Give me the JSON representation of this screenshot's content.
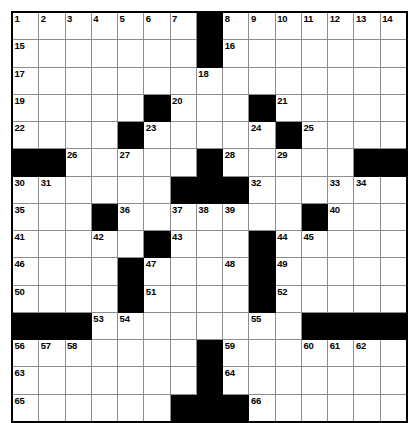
{
  "puzzle": {
    "type": "crossword-grid",
    "title": "",
    "rows": 15,
    "columns": 15,
    "colors": {
      "block": "#000000",
      "cell": "#ffffff",
      "grid_line": "#8d8d8d",
      "outer_border": "#000000",
      "number_text": "#000000"
    },
    "legend": {
      "block_label": "blocked-square",
      "open_label": "open-square"
    },
    "grid": [
      [
        {
          "block": false,
          "num": "1"
        },
        {
          "block": false,
          "num": "2"
        },
        {
          "block": false,
          "num": "3"
        },
        {
          "block": false,
          "num": "4"
        },
        {
          "block": false,
          "num": "5"
        },
        {
          "block": false,
          "num": "6"
        },
        {
          "block": false,
          "num": "7"
        },
        {
          "block": true,
          "num": ""
        },
        {
          "block": false,
          "num": "8"
        },
        {
          "block": false,
          "num": "9"
        },
        {
          "block": false,
          "num": "10"
        },
        {
          "block": false,
          "num": "11"
        },
        {
          "block": false,
          "num": "12"
        },
        {
          "block": false,
          "num": "13"
        },
        {
          "block": false,
          "num": "14"
        }
      ],
      [
        {
          "block": false,
          "num": "15"
        },
        {
          "block": false,
          "num": ""
        },
        {
          "block": false,
          "num": ""
        },
        {
          "block": false,
          "num": ""
        },
        {
          "block": false,
          "num": ""
        },
        {
          "block": false,
          "num": ""
        },
        {
          "block": false,
          "num": ""
        },
        {
          "block": true,
          "num": ""
        },
        {
          "block": false,
          "num": "16"
        },
        {
          "block": false,
          "num": ""
        },
        {
          "block": false,
          "num": ""
        },
        {
          "block": false,
          "num": ""
        },
        {
          "block": false,
          "num": ""
        },
        {
          "block": false,
          "num": ""
        },
        {
          "block": false,
          "num": ""
        }
      ],
      [
        {
          "block": false,
          "num": "17"
        },
        {
          "block": false,
          "num": ""
        },
        {
          "block": false,
          "num": ""
        },
        {
          "block": false,
          "num": ""
        },
        {
          "block": false,
          "num": ""
        },
        {
          "block": false,
          "num": ""
        },
        {
          "block": false,
          "num": ""
        },
        {
          "block": false,
          "num": "18"
        },
        {
          "block": false,
          "num": ""
        },
        {
          "block": false,
          "num": ""
        },
        {
          "block": false,
          "num": ""
        },
        {
          "block": false,
          "num": ""
        },
        {
          "block": false,
          "num": ""
        },
        {
          "block": false,
          "num": ""
        },
        {
          "block": false,
          "num": ""
        }
      ],
      [
        {
          "block": false,
          "num": "19"
        },
        {
          "block": false,
          "num": ""
        },
        {
          "block": false,
          "num": ""
        },
        {
          "block": false,
          "num": ""
        },
        {
          "block": false,
          "num": ""
        },
        {
          "block": true,
          "num": ""
        },
        {
          "block": false,
          "num": "20"
        },
        {
          "block": false,
          "num": ""
        },
        {
          "block": false,
          "num": ""
        },
        {
          "block": true,
          "num": ""
        },
        {
          "block": false,
          "num": "21"
        },
        {
          "block": false,
          "num": ""
        },
        {
          "block": false,
          "num": ""
        },
        {
          "block": false,
          "num": ""
        },
        {
          "block": false,
          "num": ""
        }
      ],
      [
        {
          "block": false,
          "num": "22"
        },
        {
          "block": false,
          "num": ""
        },
        {
          "block": false,
          "num": ""
        },
        {
          "block": false,
          "num": ""
        },
        {
          "block": true,
          "num": ""
        },
        {
          "block": false,
          "num": "23"
        },
        {
          "block": false,
          "num": ""
        },
        {
          "block": false,
          "num": ""
        },
        {
          "block": false,
          "num": ""
        },
        {
          "block": false,
          "num": "24"
        },
        {
          "block": true,
          "num": ""
        },
        {
          "block": false,
          "num": "25"
        },
        {
          "block": false,
          "num": ""
        },
        {
          "block": false,
          "num": ""
        },
        {
          "block": false,
          "num": ""
        }
      ],
      [
        {
          "block": true,
          "num": ""
        },
        {
          "block": true,
          "num": ""
        },
        {
          "block": false,
          "num": "26"
        },
        {
          "block": false,
          "num": ""
        },
        {
          "block": false,
          "num": "27"
        },
        {
          "block": false,
          "num": ""
        },
        {
          "block": false,
          "num": ""
        },
        {
          "block": true,
          "num": ""
        },
        {
          "block": false,
          "num": "28"
        },
        {
          "block": false,
          "num": ""
        },
        {
          "block": false,
          "num": "29"
        },
        {
          "block": false,
          "num": ""
        },
        {
          "block": false,
          "num": ""
        },
        {
          "block": true,
          "num": ""
        },
        {
          "block": true,
          "num": ""
        }
      ],
      [
        {
          "block": false,
          "num": "30"
        },
        {
          "block": false,
          "num": "31"
        },
        {
          "block": false,
          "num": ""
        },
        {
          "block": false,
          "num": ""
        },
        {
          "block": false,
          "num": ""
        },
        {
          "block": false,
          "num": ""
        },
        {
          "block": true,
          "num": ""
        },
        {
          "block": true,
          "num": ""
        },
        {
          "block": true,
          "num": ""
        },
        {
          "block": false,
          "num": "32"
        },
        {
          "block": false,
          "num": ""
        },
        {
          "block": false,
          "num": ""
        },
        {
          "block": false,
          "num": "33"
        },
        {
          "block": false,
          "num": "34"
        },
        {
          "block": false,
          "num": ""
        }
      ],
      [
        {
          "block": false,
          "num": "35"
        },
        {
          "block": false,
          "num": ""
        },
        {
          "block": false,
          "num": ""
        },
        {
          "block": true,
          "num": ""
        },
        {
          "block": false,
          "num": "36"
        },
        {
          "block": false,
          "num": ""
        },
        {
          "block": false,
          "num": "37"
        },
        {
          "block": false,
          "num": "38"
        },
        {
          "block": false,
          "num": "39"
        },
        {
          "block": false,
          "num": ""
        },
        {
          "block": false,
          "num": ""
        },
        {
          "block": true,
          "num": ""
        },
        {
          "block": false,
          "num": "40"
        },
        {
          "block": false,
          "num": ""
        },
        {
          "block": false,
          "num": ""
        }
      ],
      [
        {
          "block": false,
          "num": "41"
        },
        {
          "block": false,
          "num": ""
        },
        {
          "block": false,
          "num": ""
        },
        {
          "block": false,
          "num": "42"
        },
        {
          "block": false,
          "num": ""
        },
        {
          "block": true,
          "num": ""
        },
        {
          "block": false,
          "num": "43"
        },
        {
          "block": false,
          "num": ""
        },
        {
          "block": false,
          "num": ""
        },
        {
          "block": true,
          "num": ""
        },
        {
          "block": false,
          "num": "44"
        },
        {
          "block": false,
          "num": "45"
        },
        {
          "block": false,
          "num": ""
        },
        {
          "block": false,
          "num": ""
        },
        {
          "block": false,
          "num": ""
        }
      ],
      [
        {
          "block": false,
          "num": "46"
        },
        {
          "block": false,
          "num": ""
        },
        {
          "block": false,
          "num": ""
        },
        {
          "block": false,
          "num": ""
        },
        {
          "block": true,
          "num": ""
        },
        {
          "block": false,
          "num": "47"
        },
        {
          "block": false,
          "num": ""
        },
        {
          "block": false,
          "num": ""
        },
        {
          "block": false,
          "num": "48"
        },
        {
          "block": true,
          "num": ""
        },
        {
          "block": false,
          "num": "49"
        },
        {
          "block": false,
          "num": ""
        },
        {
          "block": false,
          "num": ""
        },
        {
          "block": false,
          "num": ""
        },
        {
          "block": false,
          "num": ""
        }
      ],
      [
        {
          "block": false,
          "num": "50"
        },
        {
          "block": false,
          "num": ""
        },
        {
          "block": false,
          "num": ""
        },
        {
          "block": false,
          "num": ""
        },
        {
          "block": true,
          "num": ""
        },
        {
          "block": false,
          "num": "51"
        },
        {
          "block": false,
          "num": ""
        },
        {
          "block": false,
          "num": ""
        },
        {
          "block": false,
          "num": ""
        },
        {
          "block": true,
          "num": ""
        },
        {
          "block": false,
          "num": "52"
        },
        {
          "block": false,
          "num": ""
        },
        {
          "block": false,
          "num": ""
        },
        {
          "block": false,
          "num": ""
        },
        {
          "block": false,
          "num": ""
        }
      ],
      [
        {
          "block": true,
          "num": ""
        },
        {
          "block": true,
          "num": ""
        },
        {
          "block": true,
          "num": ""
        },
        {
          "block": false,
          "num": "53"
        },
        {
          "block": false,
          "num": "54"
        },
        {
          "block": false,
          "num": ""
        },
        {
          "block": false,
          "num": ""
        },
        {
          "block": false,
          "num": ""
        },
        {
          "block": false,
          "num": ""
        },
        {
          "block": false,
          "num": "55"
        },
        {
          "block": false,
          "num": ""
        },
        {
          "block": true,
          "num": ""
        },
        {
          "block": true,
          "num": ""
        },
        {
          "block": true,
          "num": ""
        },
        {
          "block": true,
          "num": ""
        }
      ],
      [
        {
          "block": false,
          "num": "56"
        },
        {
          "block": false,
          "num": "57"
        },
        {
          "block": false,
          "num": "58"
        },
        {
          "block": false,
          "num": ""
        },
        {
          "block": false,
          "num": ""
        },
        {
          "block": false,
          "num": ""
        },
        {
          "block": false,
          "num": ""
        },
        {
          "block": true,
          "num": ""
        },
        {
          "block": false,
          "num": "59"
        },
        {
          "block": false,
          "num": ""
        },
        {
          "block": false,
          "num": ""
        },
        {
          "block": false,
          "num": "60"
        },
        {
          "block": false,
          "num": "61"
        },
        {
          "block": false,
          "num": "62"
        },
        {
          "block": false,
          "num": ""
        }
      ],
      [
        {
          "block": false,
          "num": "63"
        },
        {
          "block": false,
          "num": ""
        },
        {
          "block": false,
          "num": ""
        },
        {
          "block": false,
          "num": ""
        },
        {
          "block": false,
          "num": ""
        },
        {
          "block": false,
          "num": ""
        },
        {
          "block": false,
          "num": ""
        },
        {
          "block": true,
          "num": ""
        },
        {
          "block": false,
          "num": "64"
        },
        {
          "block": false,
          "num": ""
        },
        {
          "block": false,
          "num": ""
        },
        {
          "block": false,
          "num": ""
        },
        {
          "block": false,
          "num": ""
        },
        {
          "block": false,
          "num": ""
        },
        {
          "block": false,
          "num": ""
        }
      ],
      [
        {
          "block": false,
          "num": "65"
        },
        {
          "block": false,
          "num": ""
        },
        {
          "block": false,
          "num": ""
        },
        {
          "block": false,
          "num": ""
        },
        {
          "block": false,
          "num": ""
        },
        {
          "block": false,
          "num": ""
        },
        {
          "block": true,
          "num": ""
        },
        {
          "block": true,
          "num": ""
        },
        {
          "block": true,
          "num": ""
        },
        {
          "block": false,
          "num": "66"
        },
        {
          "block": false,
          "num": ""
        },
        {
          "block": false,
          "num": ""
        },
        {
          "block": false,
          "num": ""
        },
        {
          "block": false,
          "num": ""
        },
        {
          "block": false,
          "num": ""
        }
      ]
    ]
  }
}
